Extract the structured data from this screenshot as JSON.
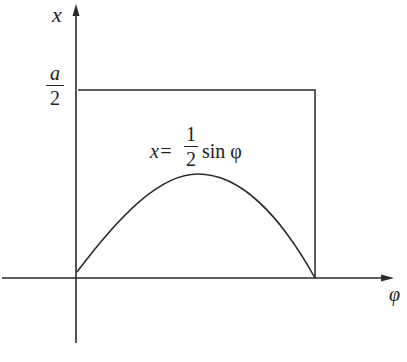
{
  "diagram": {
    "axes": {
      "y_label": "x",
      "x_label": "φ"
    },
    "y_tick": {
      "numerator": "a",
      "denominator": "2"
    },
    "equation": {
      "lhs": "x=",
      "frac_num": "1",
      "frac_den": "2",
      "rhs": "sin φ"
    },
    "shapes": {
      "rectangle": "box from φ=0 to φ=π, height a/2",
      "curve": "half sine arc x = (1/2) sin φ for φ in [0, π]"
    },
    "colors": {
      "stroke": "#2a2a2a",
      "background": "#ffffff"
    }
  }
}
